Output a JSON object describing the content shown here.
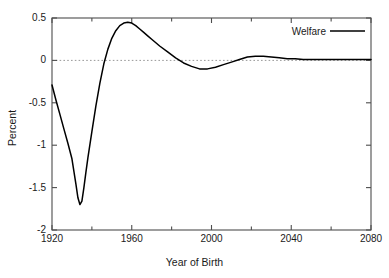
{
  "chart_data": {
    "type": "line",
    "title": "",
    "xlabel": "Year of Birth",
    "ylabel": "Percent",
    "xlim": [
      1920,
      2080
    ],
    "ylim": [
      -2,
      0.5
    ],
    "grid": false,
    "zero_reference_line": true,
    "legend_position": "top-right",
    "x_ticks": [
      "1920",
      "1960",
      "2000",
      "2040",
      "2080"
    ],
    "x_tick_values": [
      1920,
      1960,
      2000,
      2040,
      2080
    ],
    "x_minor_tick_values": [
      1940,
      1980,
      2020,
      2060
    ],
    "y_ticks": [
      "0.5",
      "0",
      "-0.5",
      "-1",
      "-1.5",
      "-2"
    ],
    "y_tick_values": [
      0.5,
      0,
      -0.5,
      -1,
      -1.5,
      -2
    ],
    "series": [
      {
        "name": "Welfare",
        "color": "#000000",
        "x": [
          1920,
          1922,
          1924,
          1926,
          1928,
          1930,
          1932,
          1933,
          1934,
          1935,
          1936,
          1937,
          1938,
          1940,
          1942,
          1944,
          1946,
          1948,
          1950,
          1952,
          1954,
          1956,
          1958,
          1960,
          1962,
          1964,
          1966,
          1968,
          1970,
          1974,
          1978,
          1982,
          1986,
          1990,
          1994,
          1998,
          2002,
          2006,
          2010,
          2014,
          2018,
          2022,
          2026,
          2030,
          2034,
          2038,
          2042,
          2046,
          2050,
          2055,
          2060,
          2065,
          2070,
          2075,
          2080
        ],
        "y": [
          -0.29,
          -0.47,
          -0.64,
          -0.81,
          -0.98,
          -1.16,
          -1.46,
          -1.62,
          -1.7,
          -1.66,
          -1.5,
          -1.32,
          -1.15,
          -0.84,
          -0.54,
          -0.27,
          -0.04,
          0.13,
          0.26,
          0.35,
          0.41,
          0.44,
          0.45,
          0.44,
          0.41,
          0.37,
          0.33,
          0.29,
          0.25,
          0.17,
          0.1,
          0.03,
          -0.03,
          -0.07,
          -0.1,
          -0.1,
          -0.08,
          -0.05,
          -0.02,
          0.01,
          0.04,
          0.05,
          0.05,
          0.04,
          0.03,
          0.02,
          0.02,
          0.01,
          0.01,
          0.01,
          0.01,
          0.01,
          0.01,
          0.01,
          0.01
        ]
      }
    ]
  },
  "legend": {
    "entries": [
      {
        "label": "Welfare",
        "color": "#000000"
      }
    ]
  },
  "axes": {
    "x": {
      "title": "Year of Birth",
      "tick_labels": [
        "1920",
        "1960",
        "2000",
        "2040",
        "2080"
      ]
    },
    "y": {
      "title": "Percent",
      "tick_labels": [
        "0.5",
        "0",
        "-0.5",
        "-1",
        "-1.5",
        "-2"
      ]
    }
  },
  "colors": {
    "line": "#000000",
    "frame": "#4d4d4d",
    "zero_line": "#999999",
    "background": "#ffffff",
    "text": "#1a1a1a"
  }
}
